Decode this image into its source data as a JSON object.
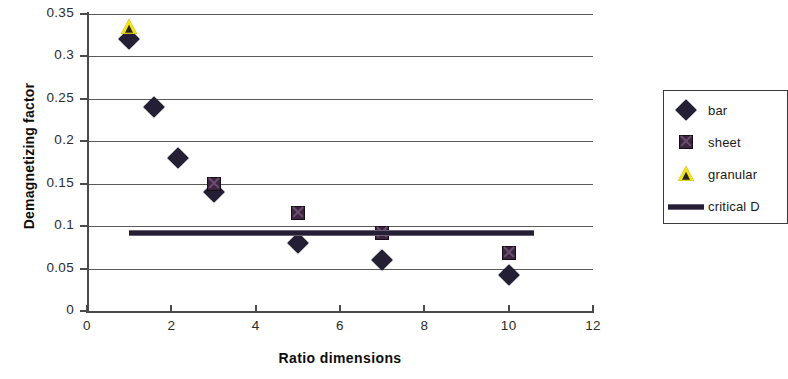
{
  "chart_data": {
    "type": "scatter",
    "title": "",
    "xlabel": "Ratio dimensions",
    "ylabel": "Demagnetizing factor",
    "xlim": [
      0,
      12
    ],
    "ylim": [
      0,
      0.35
    ],
    "xticks": [
      "0",
      "2",
      "4",
      "6",
      "8",
      "10",
      "12"
    ],
    "xtick_values": [
      0,
      2,
      4,
      6,
      8,
      10,
      12
    ],
    "yticks": [
      "0",
      "0.05",
      "0.1",
      "0.15",
      "0.2",
      "0.25",
      "0.3",
      "0.35"
    ],
    "ytick_values": [
      0,
      0.05,
      0.1,
      0.15,
      0.2,
      0.25,
      0.3,
      0.35
    ],
    "grid": "horizontal",
    "legend_position": "right-outside",
    "series": [
      {
        "name": "bar",
        "marker": "diamond",
        "color": "#241f35",
        "points": [
          {
            "x": 1.0,
            "y": 0.32
          },
          {
            "x": 1.6,
            "y": 0.24
          },
          {
            "x": 2.15,
            "y": 0.18
          },
          {
            "x": 3.0,
            "y": 0.14
          },
          {
            "x": 5.0,
            "y": 0.08
          },
          {
            "x": 7.0,
            "y": 0.06
          },
          {
            "x": 10.0,
            "y": 0.042
          }
        ]
      },
      {
        "name": "sheet",
        "marker": "square",
        "color": "#3d2540",
        "points": [
          {
            "x": 3.0,
            "y": 0.15
          },
          {
            "x": 5.0,
            "y": 0.115
          },
          {
            "x": 7.0,
            "y": 0.092
          },
          {
            "x": 10.0,
            "y": 0.068
          }
        ]
      },
      {
        "name": "granular",
        "marker": "triangle",
        "color": "#f2e21c",
        "points": [
          {
            "x": 1.0,
            "y": 0.335
          }
        ]
      },
      {
        "name": "critical D",
        "marker": "line",
        "color": "#241f35",
        "line_y": 0.092,
        "line_x_start": 1.0,
        "line_x_end": 10.6
      }
    ]
  },
  "legend": {
    "entries": [
      {
        "label": "bar",
        "marker": "diamond-icon"
      },
      {
        "label": "sheet",
        "marker": "square-icon"
      },
      {
        "label": "granular",
        "marker": "triangle-icon"
      },
      {
        "label": "critical D",
        "marker": "line-icon"
      }
    ]
  }
}
